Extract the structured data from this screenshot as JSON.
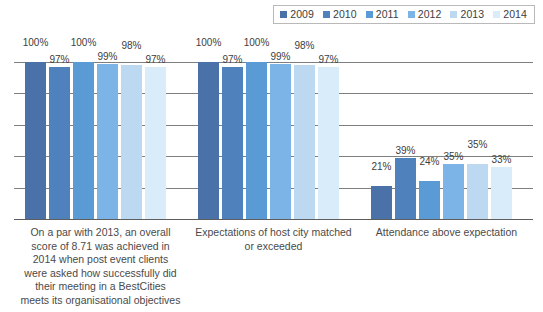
{
  "legend": {
    "items": [
      {
        "label": "2009",
        "color": "#4a72a8"
      },
      {
        "label": "2010",
        "color": "#4f81bd"
      },
      {
        "label": "2011",
        "color": "#5b9bd5"
      },
      {
        "label": "2012",
        "color": "#7cb4e8"
      },
      {
        "label": "2013",
        "color": "#bcd9f1"
      },
      {
        "label": "2014",
        "color": "#d8ecf9"
      }
    ]
  },
  "chart_data": {
    "type": "bar",
    "title": "",
    "xlabel": "",
    "ylabel": "",
    "ylim": [
      0,
      100
    ],
    "grid": true,
    "gridline_values": [
      0,
      20,
      40,
      60,
      80,
      100
    ],
    "legend_position": "top-right",
    "value_suffix": "%",
    "categories": [
      "On a par with 2013, an overall score of 8.71 was achieved in 2014 when post event clients were asked how successfully did their meeting in a BestCities meets its organisational objectives",
      "Expectations of host city matched or  exceeded",
      "Attendance above expectation"
    ],
    "series": [
      {
        "name": "2009",
        "color": "#4a72a8",
        "values": [
          100,
          100,
          21
        ],
        "labels": [
          "100%",
          "100%",
          "21%"
        ]
      },
      {
        "name": "2010",
        "color": "#4f81bd",
        "values": [
          97,
          97,
          39
        ],
        "labels": [
          "97%",
          "97%",
          "39%"
        ]
      },
      {
        "name": "2011",
        "color": "#5b9bd5",
        "values": [
          100,
          100,
          24
        ],
        "labels": [
          "100%",
          "100%",
          "24%"
        ]
      },
      {
        "name": "2012",
        "color": "#7cb4e8",
        "values": [
          99,
          99,
          35
        ],
        "labels": [
          "99%",
          "99%",
          "35%"
        ]
      },
      {
        "name": "2013",
        "color": "#bcd9f1",
        "values": [
          98,
          98,
          35
        ],
        "labels": [
          "98%",
          "98%",
          "35%"
        ]
      },
      {
        "name": "2014",
        "color": "#d8ecf9",
        "values": [
          97,
          97,
          33
        ],
        "labels": [
          "97%",
          "97%",
          "33%"
        ]
      }
    ]
  }
}
